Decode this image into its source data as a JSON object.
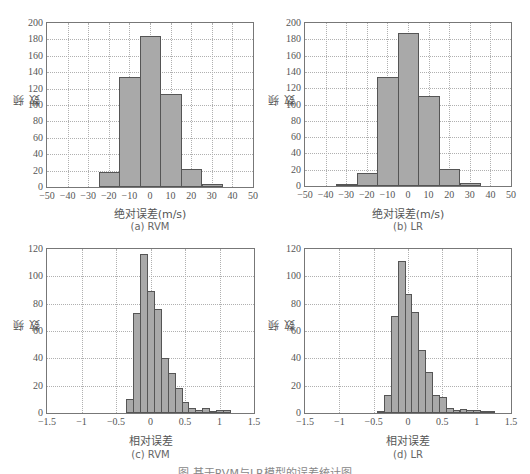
{
  "figure_caption": "图 基于RVM与LR模型的误差统计图",
  "chart_data": [
    {
      "id": "a",
      "type": "bar",
      "subcaption": "(a) RVM",
      "title": "",
      "xlabel": "绝对误差(m/s)",
      "ylabel": "频数",
      "xlim": [
        -50,
        50
      ],
      "ylim": [
        0,
        200
      ],
      "xticks": [
        -50,
        -40,
        -30,
        -20,
        -10,
        0,
        10,
        20,
        30,
        40,
        50
      ],
      "yticks": [
        0,
        20,
        40,
        60,
        80,
        100,
        120,
        140,
        160,
        180,
        200
      ],
      "grid": true,
      "bin_width": 10,
      "categories": [
        -20,
        -10,
        0,
        10,
        20,
        30
      ],
      "values": [
        18,
        134,
        184,
        113,
        22,
        4
      ]
    },
    {
      "id": "b",
      "type": "bar",
      "subcaption": "(b) LR",
      "title": "",
      "xlabel": "绝对误差(m/s)",
      "ylabel": "频数",
      "xlim": [
        -50,
        50
      ],
      "ylim": [
        0,
        200
      ],
      "xticks": [
        -50,
        -40,
        -30,
        -20,
        -10,
        0,
        10,
        20,
        30,
        40,
        50
      ],
      "yticks": [
        0,
        20,
        40,
        60,
        80,
        100,
        120,
        140,
        160,
        180,
        200
      ],
      "grid": true,
      "bin_width": 10,
      "categories": [
        -30,
        -20,
        -10,
        0,
        10,
        20,
        30
      ],
      "values": [
        1,
        16,
        134,
        188,
        110,
        21,
        4
      ]
    },
    {
      "id": "c",
      "type": "bar",
      "subcaption": "(c) RVM",
      "title": "",
      "xlabel": "相对误差",
      "ylabel": "频数",
      "xlim": [
        -1.5,
        1.5
      ],
      "ylim": [
        0,
        120
      ],
      "xticks": [
        -1.5,
        -1,
        -0.5,
        0,
        0.5,
        1,
        1.5
      ],
      "yticks": [
        0,
        20,
        40,
        60,
        80,
        100,
        120
      ],
      "grid": true,
      "bin_width": 0.1,
      "categories": [
        -0.3,
        -0.2,
        -0.1,
        0,
        0.1,
        0.2,
        0.3,
        0.4,
        0.5,
        0.6,
        0.7,
        0.8,
        0.9,
        1.0,
        1.1
      ],
      "values": [
        10,
        73,
        116,
        89,
        76,
        40,
        29,
        18,
        8,
        4,
        2,
        4,
        1,
        2,
        2
      ]
    },
    {
      "id": "d",
      "type": "bar",
      "subcaption": "(d) LR",
      "title": "",
      "xlabel": "相对误差",
      "ylabel": "频数",
      "xlim": [
        -1.5,
        1.5
      ],
      "ylim": [
        0,
        120
      ],
      "xticks": [
        -1.5,
        -1,
        -0.5,
        0,
        0.5,
        1,
        1.5
      ],
      "yticks": [
        0,
        20,
        40,
        60,
        80,
        100,
        120
      ],
      "grid": true,
      "bin_width": 0.1,
      "categories": [
        -0.4,
        -0.3,
        -0.2,
        -0.1,
        0,
        0.1,
        0.2,
        0.3,
        0.4,
        0.5,
        0.6,
        0.7,
        0.8,
        0.9,
        1.0,
        1.1,
        1.2
      ],
      "values": [
        1,
        13,
        71,
        111,
        87,
        74,
        46,
        30,
        13,
        12,
        4,
        2,
        3,
        2,
        2,
        1,
        1
      ]
    }
  ],
  "colors": {
    "bar_fill": "#a9a9a9",
    "bar_edge": "#555555",
    "axis": "#777777",
    "grid": "#b0b0b0"
  }
}
